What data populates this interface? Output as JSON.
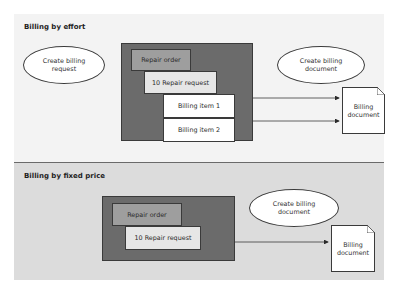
{
  "sections": {
    "effort": {
      "title": "Billing by effort",
      "create_request_label": "Create billing request",
      "create_document_label": "Create billing document",
      "repair_order": "Repair order",
      "repair_request": "10 Repair request",
      "billing_items": [
        "Billing item 1",
        "Billing item 2"
      ],
      "billing_document": "Billing document"
    },
    "fixed": {
      "title": "Billing by fixed price",
      "create_document_label": "Create billing document",
      "repair_order": "Repair order",
      "repair_request": "10 Repair request",
      "billing_document": "Billing document"
    }
  },
  "colors": {
    "effort_bg": "#f3f3f3",
    "fixed_bg": "#dcdcdc",
    "container": "#6b6b6b",
    "repair_order": "#9e9e9e",
    "repair_request": "#e6e6e6"
  }
}
